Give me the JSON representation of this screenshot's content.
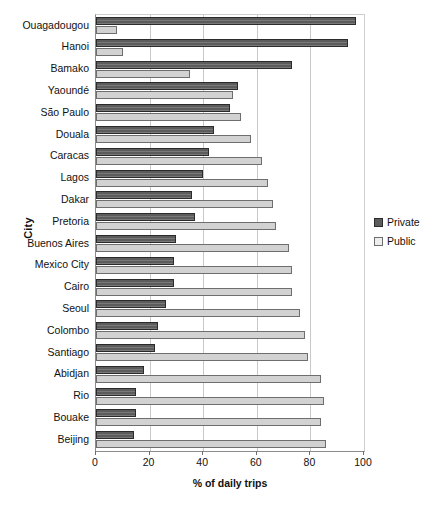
{
  "chart_data": {
    "type": "bar",
    "orientation": "horizontal",
    "title": "",
    "xlabel": "% of daily trips",
    "ylabel": "City",
    "xlim": [
      0,
      100
    ],
    "xticks": [
      0,
      20,
      40,
      60,
      80,
      100
    ],
    "grid": true,
    "legend_position": "right",
    "categories": [
      "Ouagadougou",
      "Hanoi",
      "Bamako",
      "Yaoundé",
      "São Paulo",
      "Douala",
      "Caracas",
      "Lagos",
      "Dakar",
      "Pretoria",
      "Buenos Aires",
      "Mexico City",
      "Cairo",
      "Seoul",
      "Colombo",
      "Santiago",
      "Abidjan",
      "Rio",
      "Bouake",
      "Beijing"
    ],
    "series": [
      {
        "name": "Private",
        "color": "#5c5c5c",
        "values": [
          97,
          94,
          73,
          53,
          50,
          44,
          42,
          40,
          36,
          37,
          30,
          29,
          29,
          26,
          23,
          22,
          18,
          15,
          15,
          14
        ]
      },
      {
        "name": "Public",
        "color": "#d2d2d2",
        "values": [
          8,
          10,
          35,
          51,
          54,
          58,
          62,
          64,
          66,
          67,
          72,
          73,
          73,
          76,
          78,
          79,
          84,
          85,
          84,
          86
        ]
      }
    ]
  },
  "legend": {
    "items": [
      {
        "label": "Private"
      },
      {
        "label": "Public"
      }
    ]
  }
}
